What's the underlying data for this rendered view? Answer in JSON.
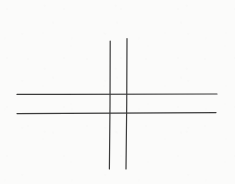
{
  "drawing": {
    "title": "Hash / tic-tac-toe grid",
    "medium": "pen on paper",
    "canvas": {
      "width": 235,
      "height": 184
    },
    "background_color": "#fbfbfa",
    "stroke_color": "#3a3a3a",
    "stroke_width": 1.2,
    "stroke_count": 4,
    "strokes": [
      {
        "name": "vertical-line-left",
        "orientation": "vertical",
        "x1": 110.2,
        "y1": 41.0,
        "x2": 109.4,
        "y2": 169.0,
        "color": "#3a3a3a",
        "width": 1.2
      },
      {
        "name": "vertical-line-right",
        "orientation": "vertical",
        "x1": 127.0,
        "y1": 38.5,
        "x2": 126.0,
        "y2": 169.0,
        "color": "#3a3a3a",
        "width": 1.2
      },
      {
        "name": "horizontal-line-top",
        "orientation": "horizontal",
        "x1": 17.0,
        "y1": 94.4,
        "x2": 217.0,
        "y2": 94.0,
        "color": "#3a3a3a",
        "width": 1.2
      },
      {
        "name": "horizontal-line-bottom",
        "orientation": "horizontal",
        "x1": 17.0,
        "y1": 113.6,
        "x2": 216.0,
        "y2": 112.6,
        "color": "#3a3a3a",
        "width": 1.2
      }
    ],
    "intersections": [
      {
        "name": "top-left-crossing",
        "x": 110,
        "y": 94
      },
      {
        "name": "top-right-crossing",
        "x": 127,
        "y": 94
      },
      {
        "name": "bottom-left-crossing",
        "x": 110,
        "y": 113
      },
      {
        "name": "bottom-right-crossing",
        "x": 126,
        "y": 113
      }
    ]
  }
}
